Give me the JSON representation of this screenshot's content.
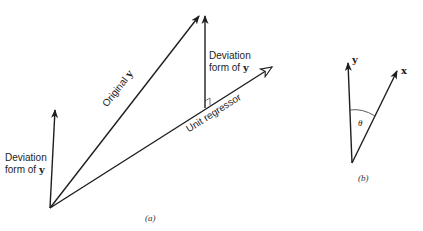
{
  "figure": {
    "panel_a": {
      "caption": "(a)",
      "labels": {
        "left_deviation_line1": "Deviation",
        "left_deviation_line2": "form of ",
        "left_deviation_var": "y",
        "original_prefix": "Original ",
        "original_var": "y",
        "right_deviation_line1": "Deviation",
        "right_deviation_line2": "form of ",
        "right_deviation_var": "y",
        "unit_regressor": "Unit regressor"
      },
      "vectors": [
        {
          "name": "deviation-form-of-y-left",
          "from": [
            50,
            208
          ],
          "to": [
            55,
            110
          ],
          "head": "solid"
        },
        {
          "name": "original-y",
          "from": [
            50,
            208
          ],
          "to": [
            199,
            16
          ],
          "head": "solid"
        },
        {
          "name": "deviation-form-of-y-right",
          "from": [
            205,
            108
          ],
          "to": [
            205,
            16
          ],
          "head": "solid"
        },
        {
          "name": "unit-regressor",
          "from": [
            50,
            208
          ],
          "to": [
            272,
            67
          ],
          "head": "open"
        }
      ],
      "right_angle_marker_at": [
        205,
        108
      ]
    },
    "panel_b": {
      "caption": "(b)",
      "labels": {
        "y_vector": "y",
        "x_vector": "x",
        "angle": "θ"
      },
      "vectors": [
        {
          "name": "y",
          "from": [
            352,
            163
          ],
          "to": [
            348,
            62
          ],
          "head": "solid"
        },
        {
          "name": "x",
          "from": [
            352,
            163
          ],
          "to": [
            397,
            70
          ],
          "head": "solid"
        }
      ]
    },
    "colors": {
      "ink": "#1e1e1e",
      "background": "#ffffff"
    }
  }
}
